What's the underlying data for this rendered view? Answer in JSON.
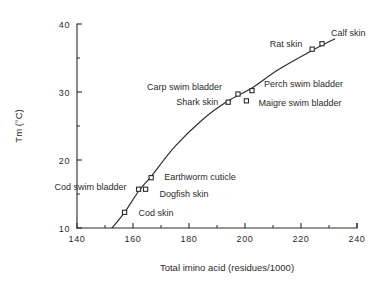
{
  "chart_data": {
    "type": "scatter",
    "title": "",
    "xlabel": "Total imino acid (residues/1000)",
    "ylabel": "Tm (°C)",
    "xlim": [
      140,
      240
    ],
    "ylim": [
      10,
      40
    ],
    "x_ticks_major": [
      140,
      160,
      180,
      200,
      220,
      240
    ],
    "x_ticks_minor": [
      150,
      170,
      190,
      210,
      230
    ],
    "y_ticks_major": [
      10,
      20,
      30,
      40
    ],
    "y_ticks_minor": [
      15,
      25,
      35
    ],
    "x_tick_labels": [
      "140",
      "160",
      "180",
      "200",
      "220",
      "240"
    ],
    "y_tick_labels": [
      "10",
      "20",
      "30",
      "40"
    ],
    "grid": false,
    "legend": "none",
    "marker_style": "open-square",
    "fit_line": "smooth curve through points",
    "points": [
      {
        "label": "Cod skin",
        "x": 157.0,
        "y": 12.3,
        "label_dx": 14,
        "label_dy": 4,
        "anchor": "start"
      },
      {
        "label": "Cod swim bladder",
        "x": 162.0,
        "y": 15.7,
        "label_dx": -12,
        "label_dy": 1,
        "anchor": "end"
      },
      {
        "label": "Dogfish skin",
        "x": 164.5,
        "y": 15.7,
        "label_dx": 14,
        "label_dy": 8,
        "anchor": "start"
      },
      {
        "label": "Earthworm cuticle",
        "x": 166.5,
        "y": 17.4,
        "label_dx": 13,
        "label_dy": 2,
        "anchor": "start"
      },
      {
        "label": "Shark skin",
        "x": 194.0,
        "y": 28.5,
        "label_dx": -10,
        "label_dy": 3,
        "anchor": "end"
      },
      {
        "label": "Carp swim bladder",
        "x": 197.5,
        "y": 29.7,
        "label_dx": -16,
        "label_dy": -4,
        "anchor": "end"
      },
      {
        "label": "Maigre swim bladder",
        "x": 200.5,
        "y": 28.7,
        "label_dx": 12,
        "label_dy": 5,
        "anchor": "start"
      },
      {
        "label": "Perch swim bladder",
        "x": 202.5,
        "y": 30.2,
        "label_dx": 12,
        "label_dy": -4,
        "anchor": "start"
      },
      {
        "label": "Rat skin",
        "x": 224.0,
        "y": 36.3,
        "label_dx": -10,
        "label_dy": -2,
        "anchor": "end"
      },
      {
        "label": "Calf skin",
        "x": 227.5,
        "y": 37.1,
        "label_dx": 9,
        "label_dy": -8,
        "anchor": "start"
      }
    ],
    "curve": [
      {
        "x": 152.5,
        "y": 10.0
      },
      {
        "x": 157.0,
        "y": 12.3
      },
      {
        "x": 162.0,
        "y": 15.4
      },
      {
        "x": 166.5,
        "y": 17.6
      },
      {
        "x": 175.0,
        "y": 22.0
      },
      {
        "x": 185.0,
        "y": 26.0
      },
      {
        "x": 194.0,
        "y": 28.7
      },
      {
        "x": 202.5,
        "y": 30.6
      },
      {
        "x": 212.0,
        "y": 33.3
      },
      {
        "x": 224.0,
        "y": 36.1
      },
      {
        "x": 232.0,
        "y": 37.8
      }
    ]
  }
}
